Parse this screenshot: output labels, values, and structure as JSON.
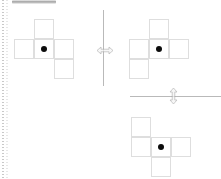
{
  "canvas": {
    "width": 221,
    "height": 179,
    "background_color": "#ffffff",
    "grid_cell_size": 20,
    "cell_border_color": "#dedede",
    "dot_color": "#0c0c0c",
    "axis_color": "#b9b9b9",
    "label": "shape reflection canvas"
  },
  "toolbar": {
    "top_bar_label": "",
    "top_bar_color": "#9f9f9f"
  },
  "ruler": {
    "label": "",
    "dot_color": "#c9c9c9"
  },
  "shapes": [
    {
      "id": "shape-left",
      "name": "original-shape",
      "label": "",
      "origin": {
        "x": 14,
        "y": 19
      },
      "cells": [
        {
          "col": 1,
          "row": 0
        },
        {
          "col": 0,
          "row": 1
        },
        {
          "col": 1,
          "row": 1
        },
        {
          "col": 2,
          "row": 1
        },
        {
          "col": 2,
          "row": 2
        }
      ],
      "anchor_dot": {
        "col": 1,
        "row": 1
      }
    },
    {
      "id": "shape-right",
      "name": "reflected-shape-horizontal",
      "label": "",
      "origin": {
        "x": 129,
        "y": 19
      },
      "cells": [
        {
          "col": 1,
          "row": 0
        },
        {
          "col": 0,
          "row": 1
        },
        {
          "col": 1,
          "row": 1
        },
        {
          "col": 2,
          "row": 1
        },
        {
          "col": 0,
          "row": 2
        }
      ],
      "anchor_dot": {
        "col": 1,
        "row": 1
      }
    },
    {
      "id": "shape-bottom",
      "name": "reflected-shape-vertical",
      "label": "",
      "origin": {
        "x": 131,
        "y": 117
      },
      "cells": [
        {
          "col": 0,
          "row": 0
        },
        {
          "col": 0,
          "row": 1
        },
        {
          "col": 1,
          "row": 1
        },
        {
          "col": 2,
          "row": 1
        },
        {
          "col": 1,
          "row": 2
        }
      ],
      "anchor_dot": {
        "col": 1,
        "row": 1
      }
    }
  ],
  "axes": [
    {
      "id": "axis-vertical",
      "name": "mirror-axis-vertical",
      "orientation": "vertical",
      "label": "",
      "x": 103,
      "y": 10,
      "length": 76
    },
    {
      "id": "axis-horizontal",
      "name": "mirror-axis-horizontal",
      "orientation": "horizontal",
      "label": "",
      "x": 130,
      "y": 96,
      "length": 91
    }
  ],
  "cursors": [
    {
      "id": "cursor-resize-horizontal",
      "name": "resize-horizontal-cursor",
      "glyph": "resize-horizontal",
      "x": 96,
      "y": 45
    },
    {
      "id": "cursor-resize-vertical",
      "name": "resize-vertical-cursor",
      "glyph": "resize-vertical",
      "x": 168,
      "y": 87
    }
  ]
}
